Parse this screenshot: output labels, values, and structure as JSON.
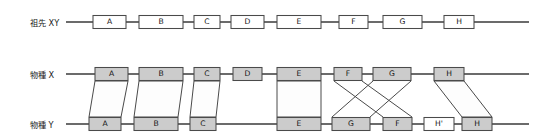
{
  "figure": {
    "background_color": "#ffffff",
    "line_color": "#3a3a3a",
    "box_stroke_color": "#4a4a4a",
    "gene_fill_shaded": "#cccccc",
    "gene_fill_open": "#ffffff",
    "ribbon_fill": "#fdfdfd",
    "text_color": "#141414"
  },
  "rows": [
    {
      "id": "ancestor",
      "label": "祖先 XY",
      "label_x": 30,
      "label_y": 26,
      "line_y": 22,
      "line_x1": 66,
      "line_x2": 529,
      "genes": [
        {
          "name": "A",
          "x": 93,
          "w": 33,
          "fill": "#ffffff"
        },
        {
          "name": "B",
          "x": 139,
          "w": 44,
          "fill": "#ffffff"
        },
        {
          "name": "C",
          "x": 194,
          "w": 26,
          "fill": "#ffffff"
        },
        {
          "name": "D",
          "x": 231,
          "w": 33,
          "fill": "#ffffff"
        },
        {
          "name": "E",
          "x": 277,
          "w": 44,
          "fill": "#ffffff"
        },
        {
          "name": "F",
          "x": 339,
          "w": 29,
          "fill": "#ffffff"
        },
        {
          "name": "G",
          "x": 383,
          "w": 39,
          "fill": "#ffffff"
        },
        {
          "name": "H",
          "x": 444,
          "w": 30,
          "fill": "#ffffff"
        }
      ]
    },
    {
      "id": "species-x",
      "label": "物種 X",
      "label_x": 30,
      "label_y": 78,
      "line_y": 74,
      "line_x1": 66,
      "line_x2": 529,
      "genes": [
        {
          "name": "A",
          "x": 95,
          "w": 33,
          "fill": "#cccccc"
        },
        {
          "name": "B",
          "x": 139,
          "w": 44,
          "fill": "#cccccc"
        },
        {
          "name": "C",
          "x": 194,
          "w": 26,
          "fill": "#cccccc"
        },
        {
          "name": "D",
          "x": 233,
          "w": 29,
          "fill": "#cccccc"
        },
        {
          "name": "E",
          "x": 277,
          "w": 44,
          "fill": "#cccccc"
        },
        {
          "name": "F",
          "x": 334,
          "w": 28,
          "fill": "#cccccc"
        },
        {
          "name": "G",
          "x": 373,
          "w": 38,
          "fill": "#cccccc"
        },
        {
          "name": "H",
          "x": 434,
          "w": 30,
          "fill": "#cccccc"
        }
      ]
    },
    {
      "id": "species-y",
      "label": "物種 Y",
      "label_x": 30,
      "label_y": 128,
      "line_y": 124,
      "line_x1": 66,
      "line_x2": 529,
      "genes": [
        {
          "name": "A",
          "x": 89,
          "w": 32,
          "fill": "#cccccc"
        },
        {
          "name": "B",
          "x": 134,
          "w": 44,
          "fill": "#cccccc"
        },
        {
          "name": "C",
          "x": 190,
          "w": 26,
          "fill": "#cccccc"
        },
        {
          "name": "E",
          "x": 277,
          "w": 44,
          "fill": "#cccccc"
        },
        {
          "name": "G",
          "x": 332,
          "w": 38,
          "fill": "#cccccc"
        },
        {
          "name": "F",
          "x": 383,
          "w": 29,
          "fill": "#cccccc"
        },
        {
          "name": "H'",
          "x": 424,
          "w": 30,
          "fill": "#ffffff"
        },
        {
          "name": "H",
          "x": 462,
          "w": 30,
          "fill": "#cccccc"
        }
      ]
    }
  ],
  "ribbons": [
    {
      "name": "ribbon-A",
      "top_x1": 95,
      "top_x2": 128,
      "bottom_x1": 89,
      "bottom_x2": 121
    },
    {
      "name": "ribbon-B",
      "top_x1": 139,
      "top_x2": 183,
      "bottom_x1": 134,
      "bottom_x2": 178
    },
    {
      "name": "ribbon-C",
      "top_x1": 194,
      "top_x2": 220,
      "bottom_x1": 190,
      "bottom_x2": 216
    },
    {
      "name": "ribbon-E",
      "top_x1": 277,
      "top_x2": 321,
      "bottom_x1": 277,
      "bottom_x2": 321
    },
    {
      "name": "ribbon-H",
      "top_x1": 434,
      "top_x2": 464,
      "bottom_x1": 462,
      "bottom_x2": 492
    }
  ],
  "crossings": [
    {
      "name": "crossing-F",
      "top_x1": 334,
      "top_x2": 362,
      "bottom_x1": 383,
      "bottom_x2": 412
    },
    {
      "name": "crossing-G",
      "top_x1": 373,
      "top_x2": 411,
      "bottom_x1": 332,
      "bottom_x2": 370
    }
  ],
  "geometry": {
    "box_height": 13,
    "ribbon_top_y": 81,
    "ribbon_bottom_y": 117
  }
}
